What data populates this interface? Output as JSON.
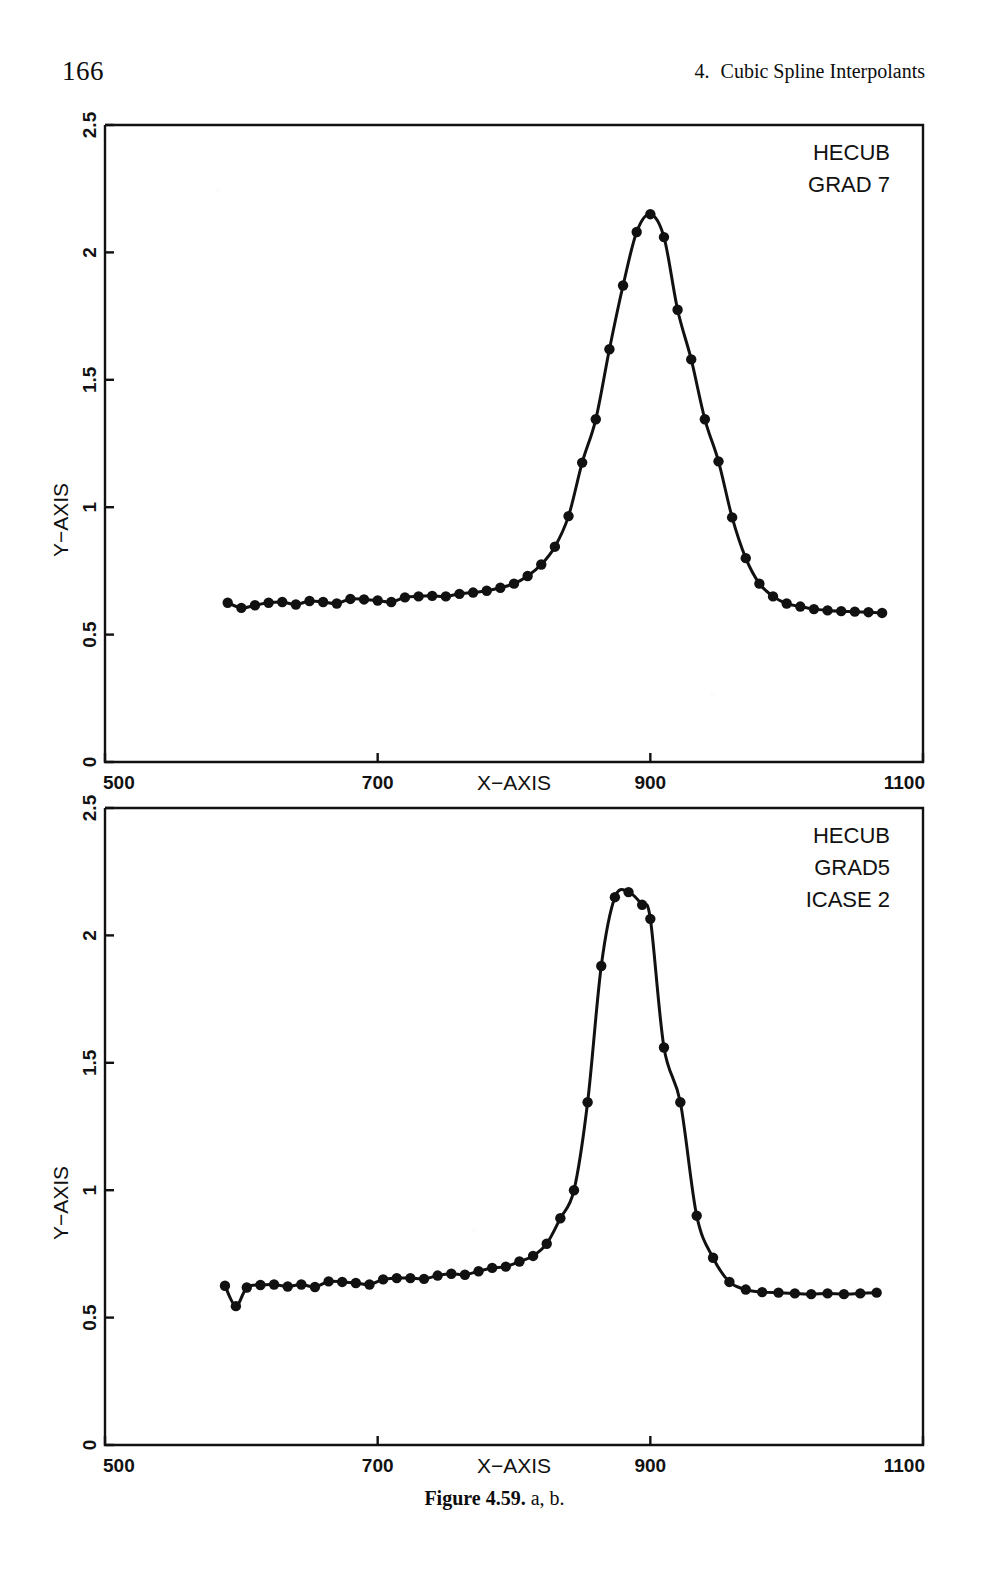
{
  "page": {
    "number": "166",
    "running_head_number": "4.",
    "running_head_title": "Cubic Spline Interpolants",
    "caption_label": "Figure 4.59.",
    "caption_parts": "a, b.",
    "ink_color": "#111111",
    "paper_color": "#ffffff"
  },
  "chart_data": [
    {
      "id": "figure-4-59-a",
      "type": "line",
      "title": "",
      "xlabel": "X−AXIS",
      "ylabel": "Y−AXIS",
      "xlim": [
        500,
        1100
      ],
      "ylim": [
        0,
        2.5
      ],
      "xticks": [
        500,
        700,
        900,
        1100
      ],
      "xticklabels": [
        "500",
        "700",
        "900",
        "1100"
      ],
      "yticks": [
        0,
        0.5,
        1,
        1.5,
        2,
        2.5
      ],
      "yticklabels": [
        "0",
        "0.5",
        "1",
        "1.5",
        "2",
        "2.5"
      ],
      "grid": false,
      "legend_position": "top-right-inside",
      "annotations": [
        "HECUB",
        "GRAD 7"
      ],
      "marker": "filled-circle",
      "series": [
        {
          "name": "HECUB GRAD 7",
          "x": [
            590,
            600,
            610,
            620,
            630,
            640,
            650,
            660,
            670,
            680,
            690,
            700,
            710,
            720,
            730,
            740,
            750,
            760,
            770,
            780,
            790,
            800,
            810,
            820,
            830,
            840,
            850,
            860,
            870,
            880,
            890,
            900,
            910,
            920,
            930,
            940,
            950,
            960,
            970,
            980,
            990,
            1000,
            1010,
            1020,
            1030,
            1040,
            1050,
            1060,
            1070
          ],
          "y": [
            0.625,
            0.605,
            0.615,
            0.625,
            0.628,
            0.618,
            0.632,
            0.628,
            0.622,
            0.64,
            0.638,
            0.634,
            0.628,
            0.646,
            0.65,
            0.652,
            0.65,
            0.66,
            0.665,
            0.672,
            0.684,
            0.7,
            0.73,
            0.775,
            0.845,
            0.965,
            1.175,
            1.345,
            1.62,
            1.87,
            2.08,
            2.15,
            2.06,
            1.775,
            1.58,
            1.345,
            1.18,
            0.96,
            0.8,
            0.7,
            0.65,
            0.622,
            0.61,
            0.6,
            0.595,
            0.592,
            0.59,
            0.588,
            0.585
          ]
        }
      ]
    },
    {
      "id": "figure-4-59-b",
      "type": "line",
      "title": "",
      "xlabel": "X−AXIS",
      "ylabel": "Y−AXIS",
      "xlim": [
        500,
        1100
      ],
      "ylim": [
        0,
        2.5
      ],
      "xticks": [
        500,
        700,
        900,
        1100
      ],
      "xticklabels": [
        "500",
        "700",
        "900",
        "1100"
      ],
      "yticks": [
        0,
        0.5,
        1,
        1.5,
        2,
        2.5
      ],
      "yticklabels": [
        "0",
        "0.5",
        "1",
        "1.5",
        "2",
        "2.5"
      ],
      "grid": false,
      "legend_position": "top-right-inside",
      "annotations": [
        "HECUB",
        "GRAD5",
        "ICASE 2"
      ],
      "marker": "filled-circle",
      "series": [
        {
          "name": "HECUB GRAD5 ICASE 2",
          "x": [
            588,
            596,
            604,
            614,
            624,
            634,
            644,
            654,
            664,
            674,
            684,
            694,
            704,
            714,
            724,
            734,
            744,
            754,
            764,
            774,
            784,
            794,
            804,
            814,
            824,
            834,
            844,
            854,
            864,
            874,
            884,
            894,
            900,
            910,
            922,
            934,
            946,
            958,
            970,
            982,
            994,
            1006,
            1018,
            1030,
            1042,
            1054,
            1066
          ],
          "y": [
            0.625,
            0.545,
            0.618,
            0.628,
            0.63,
            0.622,
            0.63,
            0.62,
            0.642,
            0.64,
            0.636,
            0.63,
            0.65,
            0.655,
            0.655,
            0.652,
            0.665,
            0.672,
            0.668,
            0.682,
            0.695,
            0.7,
            0.72,
            0.742,
            0.79,
            0.89,
            1.0,
            1.345,
            1.88,
            2.15,
            2.17,
            2.12,
            2.065,
            1.56,
            1.345,
            0.9,
            0.735,
            0.64,
            0.61,
            0.6,
            0.598,
            0.595,
            0.592,
            0.595,
            0.592,
            0.595,
            0.598
          ]
        }
      ]
    }
  ],
  "axis_geometry": {
    "plot_left": 105,
    "plot_right": 923,
    "panel_a_top": 125,
    "panel_a_bottom": 762,
    "panel_b_top": 808,
    "panel_b_bottom": 1445
  }
}
